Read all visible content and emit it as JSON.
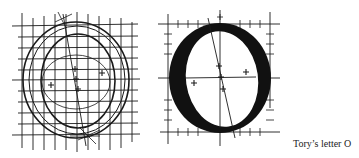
{
  "caption": "Tory’s letter O",
  "figures": [
    {
      "name": "construction-o",
      "description": "Letter O constructed on a square grid with compass arcs and center marks"
    },
    {
      "name": "finished-o",
      "description": "Finished bold letter O on a ruled frame with tick marks and center marks"
    }
  ],
  "colors": {
    "ink": "#1a1a1a",
    "background": "#ffffff"
  }
}
